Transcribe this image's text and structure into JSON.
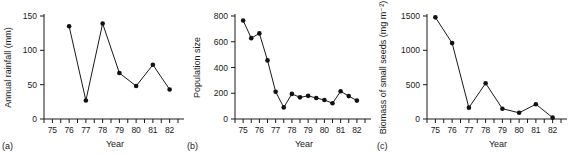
{
  "figure": {
    "panel_count": 3,
    "background_color": "#ffffff",
    "ink_color": "#1a1a1a",
    "marker_color": "#111111"
  },
  "panels": [
    {
      "tag": "(a)",
      "ylabel": "Annual rainfall (mm)",
      "xlabel": "Year",
      "y_ticks": [
        "0",
        "50",
        "100",
        "150"
      ],
      "x_ticks": [
        "75",
        "76",
        "77",
        "78",
        "79",
        "80",
        "81",
        "82"
      ]
    },
    {
      "tag": "(b)",
      "ylabel": "Population size",
      "xlabel": "Year",
      "y_ticks": [
        "0",
        "200",
        "400",
        "600",
        "800"
      ],
      "x_ticks": [
        "75",
        "76",
        "77",
        "78",
        "79",
        "80",
        "81",
        "82"
      ]
    },
    {
      "tag": "(c)",
      "ylabel": "Biomass of small seeds (mg m⁻²)",
      "xlabel": "Year",
      "y_ticks": [
        "0",
        "500",
        "1000",
        "1500"
      ],
      "x_ticks": [
        "75",
        "76",
        "77",
        "78",
        "79",
        "80",
        "81",
        "82"
      ]
    }
  ],
  "chart_data": [
    {
      "type": "line",
      "panel": "(a)",
      "title": "",
      "xlabel": "Year",
      "ylabel": "Annual rainfall (mm)",
      "xlim": [
        74.5,
        82.5
      ],
      "ylim": [
        0,
        150
      ],
      "xticks": [
        75,
        76,
        77,
        78,
        79,
        80,
        81,
        82
      ],
      "xticklabels": [
        "75",
        "76",
        "77",
        "78",
        "79",
        "80",
        "81",
        "82"
      ],
      "yticks": [
        0,
        50,
        100,
        150
      ],
      "yticklabels": [
        "0",
        "50",
        "100",
        "150"
      ],
      "grid": false,
      "legend": false,
      "markers": "filled-circle",
      "x": [
        76,
        77,
        78,
        79,
        80,
        81,
        82
      ],
      "values": [
        135,
        27,
        139,
        67,
        48,
        79,
        43
      ]
    },
    {
      "type": "line",
      "panel": "(b)",
      "title": "",
      "xlabel": "Year",
      "ylabel": "Population size",
      "xlim": [
        74.5,
        82.5
      ],
      "ylim": [
        0,
        800
      ],
      "xticks": [
        75,
        76,
        77,
        78,
        79,
        80,
        81,
        82
      ],
      "xticklabels": [
        "75",
        "76",
        "77",
        "78",
        "79",
        "80",
        "81",
        "82"
      ],
      "yticks": [
        0,
        200,
        400,
        600,
        800
      ],
      "yticklabels": [
        "0",
        "200",
        "400",
        "600",
        "800"
      ],
      "grid": false,
      "legend": false,
      "markers": "filled-circle",
      "x": [
        75.0,
        75.5,
        76.0,
        76.5,
        77.0,
        77.5,
        78.0,
        78.5,
        79.0,
        79.5,
        80.0,
        80.5,
        81.0,
        81.5,
        82.0
      ],
      "values": [
        765,
        628,
        665,
        455,
        212,
        90,
        195,
        168,
        180,
        163,
        148,
        122,
        215,
        178,
        143
      ]
    },
    {
      "type": "line",
      "panel": "(c)",
      "title": "",
      "xlabel": "Year",
      "ylabel": "Biomass of small seeds (mg m⁻²)",
      "xlim": [
        74.5,
        82.5
      ],
      "ylim": [
        0,
        1500
      ],
      "xticks": [
        75,
        76,
        77,
        78,
        79,
        80,
        81,
        82
      ],
      "xticklabels": [
        "75",
        "76",
        "77",
        "78",
        "79",
        "80",
        "81",
        "82"
      ],
      "yticks": [
        0,
        500,
        1000,
        1500
      ],
      "yticklabels": [
        "0",
        "500",
        "1000",
        "1500"
      ],
      "grid": false,
      "legend": false,
      "markers": "filled-circle",
      "x": [
        75,
        76,
        77,
        78,
        79,
        80,
        81,
        82
      ],
      "values": [
        1480,
        1105,
        165,
        520,
        150,
        90,
        215,
        20
      ]
    }
  ]
}
